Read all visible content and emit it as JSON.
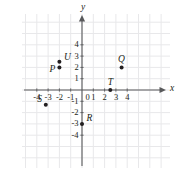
{
  "figure": {
    "type": "coordinate-plane",
    "background_color": "#ffffff",
    "grid_color": "#e8e8ea",
    "axis_color": "#58595b",
    "ink_color": "#231f20"
  },
  "axes": {
    "x_label": "x",
    "y_label": "y",
    "x_ticks": [
      "-4",
      "-3",
      "-2",
      "-1",
      "0",
      "1",
      "2",
      "3",
      "4"
    ],
    "y_ticks": [
      "4",
      "3",
      "2",
      "1",
      "-1",
      "-2",
      "-3",
      "-4"
    ],
    "origin_label": "0"
  },
  "chart_data": {
    "type": "scatter",
    "title": "",
    "xlabel": "x",
    "ylabel": "y",
    "xlim": [
      -4.6,
      4.6
    ],
    "ylim": [
      -4.6,
      4.6
    ],
    "grid": true,
    "legend": "none",
    "xticks": [
      -4,
      -3,
      -2,
      -1,
      0,
      1,
      2,
      3,
      4
    ],
    "yticks": [
      -4,
      -3,
      -2,
      -1,
      1,
      2,
      3,
      4
    ],
    "points": [
      {
        "name": "U",
        "x": -2.0,
        "y": 2.5
      },
      {
        "name": "P",
        "x": -2.0,
        "y": 2.0
      },
      {
        "name": "Q",
        "x": 3.5,
        "y": 2.0
      },
      {
        "name": "T",
        "x": 2.5,
        "y": 0.0
      },
      {
        "name": "S",
        "x": -3.2,
        "y": -1.3
      },
      {
        "name": "R",
        "x": 0.0,
        "y": -3.0
      }
    ]
  }
}
